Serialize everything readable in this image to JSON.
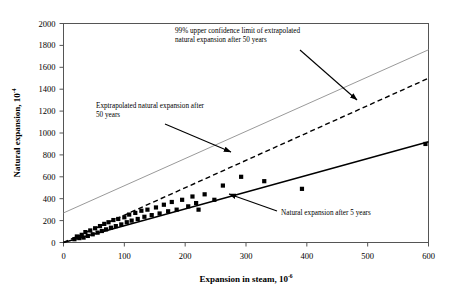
{
  "chart_data": {
    "type": "scatter",
    "title": "",
    "xlabel": "Expansion in steam, 10",
    "xlabel_exponent": "-6",
    "ylabel": "Natural expansion, 10",
    "ylabel_exponent": "-4",
    "xlim": [
      0,
      600
    ],
    "ylim": [
      0,
      2000
    ],
    "xticks": [
      0,
      100,
      200,
      300,
      400,
      500,
      600
    ],
    "yticks": [
      0,
      200,
      400,
      600,
      800,
      1000,
      1200,
      1400,
      1600,
      1800,
      2000
    ],
    "grid": false,
    "legend": "none",
    "marker": "filled-square",
    "marker_color": "#000000",
    "points": [
      {
        "x": 18,
        "y": 30
      },
      {
        "x": 22,
        "y": 55
      },
      {
        "x": 26,
        "y": 40
      },
      {
        "x": 30,
        "y": 70
      },
      {
        "x": 33,
        "y": 45
      },
      {
        "x": 36,
        "y": 95
      },
      {
        "x": 40,
        "y": 60
      },
      {
        "x": 44,
        "y": 110
      },
      {
        "x": 48,
        "y": 75
      },
      {
        "x": 52,
        "y": 130
      },
      {
        "x": 56,
        "y": 90
      },
      {
        "x": 60,
        "y": 150
      },
      {
        "x": 63,
        "y": 105
      },
      {
        "x": 67,
        "y": 170
      },
      {
        "x": 70,
        "y": 120
      },
      {
        "x": 74,
        "y": 185
      },
      {
        "x": 78,
        "y": 135
      },
      {
        "x": 82,
        "y": 205
      },
      {
        "x": 86,
        "y": 150
      },
      {
        "x": 90,
        "y": 215
      },
      {
        "x": 95,
        "y": 165
      },
      {
        "x": 100,
        "y": 230
      },
      {
        "x": 104,
        "y": 185
      },
      {
        "x": 108,
        "y": 255
      },
      {
        "x": 112,
        "y": 200
      },
      {
        "x": 118,
        "y": 270
      },
      {
        "x": 122,
        "y": 215
      },
      {
        "x": 128,
        "y": 290
      },
      {
        "x": 133,
        "y": 235
      },
      {
        "x": 138,
        "y": 300
      },
      {
        "x": 145,
        "y": 250
      },
      {
        "x": 152,
        "y": 320
      },
      {
        "x": 158,
        "y": 265
      },
      {
        "x": 165,
        "y": 345
      },
      {
        "x": 172,
        "y": 285
      },
      {
        "x": 178,
        "y": 370
      },
      {
        "x": 186,
        "y": 300
      },
      {
        "x": 195,
        "y": 390
      },
      {
        "x": 205,
        "y": 330
      },
      {
        "x": 212,
        "y": 420
      },
      {
        "x": 218,
        "y": 360
      },
      {
        "x": 222,
        "y": 300
      },
      {
        "x": 232,
        "y": 440
      },
      {
        "x": 248,
        "y": 390
      },
      {
        "x": 262,
        "y": 520
      },
      {
        "x": 292,
        "y": 600
      },
      {
        "x": 330,
        "y": 560
      },
      {
        "x": 392,
        "y": 490
      },
      {
        "x": 595,
        "y": 900
      }
    ],
    "lines": [
      {
        "name": "99% upper confidence limit of extrapolated natural expansion after 50 years",
        "style": "solid",
        "color": "#9a9a9a",
        "width": 1,
        "x0": 0,
        "y0": 270,
        "x1": 600,
        "y1": 1760
      },
      {
        "name": "Exptrapolated natural expansion after 50 years",
        "style": "dashed",
        "color": "#000000",
        "width": 1.4,
        "x0": 0,
        "y0": 0,
        "x1": 600,
        "y1": 1500
      },
      {
        "name": "Natural expansion after 5 years",
        "style": "solid",
        "color": "#000000",
        "width": 1.4,
        "x0": 0,
        "y0": 0,
        "x1": 600,
        "y1": 920
      }
    ],
    "annotations": [
      {
        "id": "upper-confidence",
        "line1": "99% upper confidence limit of extrapolated",
        "line2": "natural expansion after 50 years",
        "text_x": 175,
        "text_y": 33,
        "arrow_from_x": 300,
        "arrow_from_y": 50,
        "arrow_to_x": 357,
        "arrow_to_y": 100
      },
      {
        "id": "extrapolated-50-years",
        "line1": "Exptrapolated natural expansion after",
        "line2": "50 years",
        "text_x": 96,
        "text_y": 108,
        "arrow_from_x": 165,
        "arrow_from_y": 124,
        "arrow_to_x": 231,
        "arrow_to_y": 152
      },
      {
        "id": "natural-expansion-5-years",
        "line1": "Natural expansion after 5 years",
        "line2": "",
        "text_x": 281,
        "text_y": 215,
        "arrow_from_x": 277,
        "arrow_from_y": 211,
        "arrow_to_x": 229,
        "arrow_to_y": 194
      }
    ]
  }
}
